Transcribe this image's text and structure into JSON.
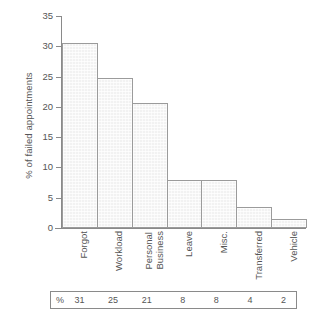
{
  "chart_data": {
    "type": "bar",
    "title": "",
    "subtitle": "",
    "xlabel": "",
    "ylabel": "% of failed appointments",
    "ylim": [
      0,
      35
    ],
    "ytick_labels": [
      "0",
      "5",
      "10",
      "15",
      "20",
      "25",
      "30",
      "35"
    ],
    "ytick_values": [
      0,
      5,
      10,
      15,
      20,
      25,
      30,
      35
    ],
    "grid": false,
    "legend": "none",
    "categories": [
      "Forgot",
      "Workload",
      "Personal Business",
      "Leave",
      "Misc.",
      "Transferred",
      "Vehicle"
    ],
    "category_lines": [
      [
        "Forgot"
      ],
      [
        "Workload"
      ],
      [
        "Personal",
        "Business"
      ],
      [
        "Leave"
      ],
      [
        "Misc."
      ],
      [
        "Transferred"
      ],
      [
        "Vehicle"
      ]
    ],
    "values": [
      30.6,
      24.8,
      20.6,
      8.0,
      8.0,
      3.5,
      1.5
    ],
    "data_table": {
      "row_header": "%",
      "values": [
        "31",
        "25",
        "21",
        "8",
        "8",
        "4",
        "2"
      ]
    },
    "colors": {
      "bar_fill": "#f2f2f2",
      "bar_border": "#9b9b9b",
      "axis": "#8a8a8a",
      "text": "#555555",
      "background": "#ffffff"
    }
  }
}
